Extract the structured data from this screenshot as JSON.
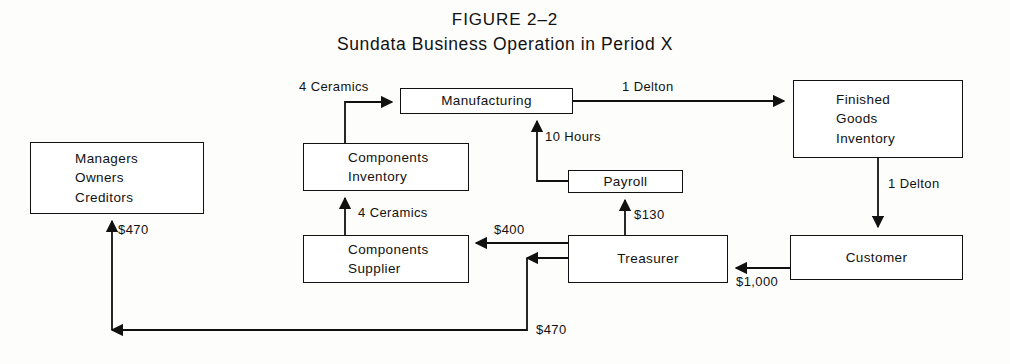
{
  "figure": {
    "title_line1": "FIGURE 2–2",
    "title_line2": "Sundata Business Operation in Period X"
  },
  "nodes": {
    "managers": {
      "line1": "Managers",
      "line2": "Owners",
      "line3": "Creditors"
    },
    "components_inventory": {
      "line1": "Components",
      "line2": "Inventory"
    },
    "components_supplier": {
      "line1": "Components",
      "line2": "Supplier"
    },
    "manufacturing": {
      "line1": "Manufacturing"
    },
    "payroll": {
      "line1": "Payroll"
    },
    "treasurer": {
      "line1": "Treasurer"
    },
    "finished_goods": {
      "line1": "Finished",
      "line2": "Goods",
      "line3": "Inventory"
    },
    "customer": {
      "line1": "Customer"
    }
  },
  "edge_labels": {
    "ceramics_to_manufacturing": "4 Ceramics",
    "ceramics_to_inventory": "4 Ceramics",
    "delton_to_finished_goods": "1 Delton",
    "delton_to_customer": "1 Delton",
    "hours_to_manufacturing": "10 Hours",
    "payroll_from_treasurer": "$130",
    "supplier_payment": "$400",
    "customer_payment": "$1,000",
    "distribution_up": "$470",
    "distribution_bottom": "$470"
  },
  "colors": {
    "ink": "#111111",
    "paper": "#fdfdfc"
  }
}
